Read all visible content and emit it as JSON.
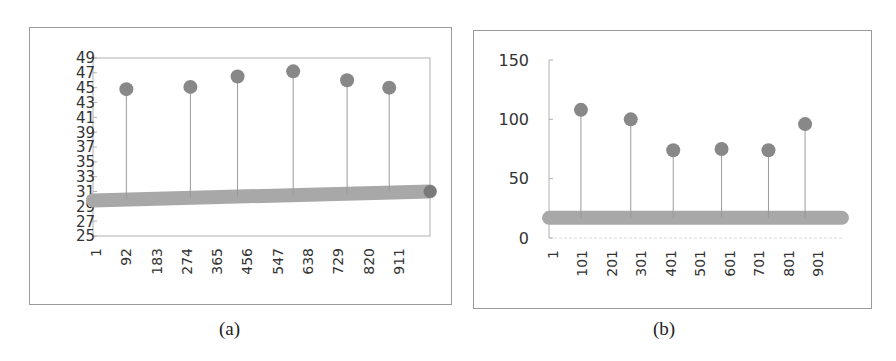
{
  "captions": {
    "a": "(a)",
    "b": "(b)"
  },
  "colors": {
    "marker": "#888888",
    "baseline": "#a8a8a8",
    "stem": "#9a9a9a",
    "axis": "#b0b0b0",
    "text": "#333333"
  },
  "chart_data": [
    {
      "id": "a",
      "type": "scatter",
      "subtype": "stem",
      "title": "",
      "caption": "(a)",
      "xlabel": "",
      "ylabel": "",
      "ylim": [
        25,
        49
      ],
      "yticks": [
        25,
        27,
        29,
        31,
        33,
        35,
        37,
        39,
        41,
        43,
        45,
        47,
        49
      ],
      "xticks": [
        "1",
        "92",
        "183",
        "274",
        "365",
        "456",
        "547",
        "638",
        "729",
        "820",
        "911"
      ],
      "xrange": [
        1,
        1001
      ],
      "grid": false,
      "legend": null,
      "baseline_series": {
        "name": "baseline",
        "x_start": 1,
        "x_end": 1001,
        "y_start": 29.8,
        "y_end": 31,
        "note": "dense run of points forming thick band"
      },
      "series": [
        {
          "name": "peaks",
          "x": [
            100,
            290,
            430,
            595,
            755,
            880
          ],
          "values": [
            44.8,
            45.1,
            46.5,
            47.2,
            46.0,
            45.0
          ]
        }
      ],
      "end_point": {
        "x": 1001,
        "y": 31
      }
    },
    {
      "id": "b",
      "type": "scatter",
      "subtype": "stem",
      "title": "",
      "caption": "(b)",
      "xlabel": "",
      "ylabel": "",
      "ylim": [
        0,
        150
      ],
      "yticks": [
        0,
        50,
        100,
        150
      ],
      "xticks": [
        "1",
        "101",
        "201",
        "301",
        "401",
        "501",
        "601",
        "701",
        "801",
        "901"
      ],
      "xrange": [
        1,
        1001
      ],
      "grid": false,
      "legend": null,
      "baseline_series": {
        "name": "baseline",
        "x_start": 1,
        "x_end": 1001,
        "y": 17,
        "note": "dense run of points forming thick band"
      },
      "series": [
        {
          "name": "peaks",
          "x": [
            110,
            280,
            425,
            590,
            750,
            875
          ],
          "values": [
            108,
            100,
            74,
            75,
            74,
            96
          ]
        }
      ]
    }
  ]
}
